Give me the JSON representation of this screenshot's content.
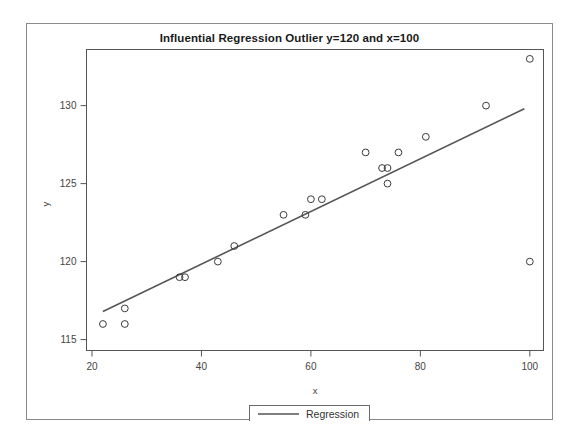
{
  "chart_data": {
    "type": "scatter",
    "title": "Influential Regression Outlier y=120 and x=100",
    "xlabel": "x",
    "ylabel": "y",
    "xlim": [
      19.0,
      102.5
    ],
    "ylim": [
      114.3,
      133.6
    ],
    "xticks": [
      20,
      40,
      60,
      80,
      100
    ],
    "yticks": [
      115,
      120,
      125,
      130
    ],
    "grid": false,
    "legend_position": "bottom-center",
    "legend": [
      {
        "name": "Regression",
        "type": "line",
        "color": "#555555"
      }
    ],
    "points": [
      {
        "x": 22,
        "y": 116
      },
      {
        "x": 26,
        "y": 117
      },
      {
        "x": 26,
        "y": 116
      },
      {
        "x": 36,
        "y": 119
      },
      {
        "x": 37,
        "y": 119
      },
      {
        "x": 43,
        "y": 120
      },
      {
        "x": 46,
        "y": 121
      },
      {
        "x": 55,
        "y": 123
      },
      {
        "x": 59,
        "y": 123
      },
      {
        "x": 60,
        "y": 124
      },
      {
        "x": 62,
        "y": 124
      },
      {
        "x": 70,
        "y": 127
      },
      {
        "x": 73,
        "y": 126
      },
      {
        "x": 74,
        "y": 126
      },
      {
        "x": 74,
        "y": 125
      },
      {
        "x": 76,
        "y": 127
      },
      {
        "x": 81,
        "y": 128
      },
      {
        "x": 92,
        "y": 130
      },
      {
        "x": 100,
        "y": 133
      },
      {
        "x": 100,
        "y": 120
      }
    ],
    "series": [
      {
        "name": "Regression",
        "type": "line",
        "color": "#555555",
        "x": [
          22.0,
          99.0
        ],
        "y": [
          116.8,
          129.8
        ]
      }
    ],
    "marker_style": {
      "shape": "circle-open",
      "radius": 3.4,
      "stroke": "#3b3b3b"
    }
  },
  "tick_labels": {
    "x": [
      "20",
      "40",
      "60",
      "80",
      "100"
    ],
    "y": [
      "115",
      "120",
      "125",
      "130"
    ]
  },
  "axis_titles": {
    "x": "x",
    "y": "y"
  },
  "legend_text": {
    "regression": "Regression"
  },
  "colors": {
    "marker_stroke": "#3b3b3b",
    "line": "#555555",
    "axis": "#555555",
    "frame": "#8a8a8a",
    "background": "#ffffff",
    "title_text": "#1a1a1a",
    "tick_text": "#444444"
  }
}
